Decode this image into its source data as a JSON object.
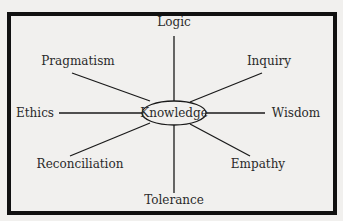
{
  "diagram": {
    "type": "mind-map",
    "center": {
      "label": "Knowledge",
      "x": 174,
      "y": 113,
      "rx": 32,
      "ry": 12
    },
    "nodes": [
      {
        "label": "Logic",
        "x": 174,
        "y": 26,
        "anchor": "middle",
        "line": [
          174,
          36,
          174,
          101
        ]
      },
      {
        "label": "Inquiry",
        "x": 269,
        "y": 65,
        "anchor": "middle",
        "line": [
          262,
          73,
          190,
          102
        ]
      },
      {
        "label": "Wisdom",
        "x": 296,
        "y": 117,
        "anchor": "middle",
        "line": [
          265,
          113,
          206,
          113
        ]
      },
      {
        "label": "Empathy",
        "x": 258,
        "y": 168,
        "anchor": "middle",
        "line": [
          250,
          156,
          190,
          124
        ]
      },
      {
        "label": "Tolerance",
        "x": 174,
        "y": 204,
        "anchor": "middle",
        "line": [
          174,
          193,
          174,
          125
        ]
      },
      {
        "label": "Reconciliation",
        "x": 80,
        "y": 168,
        "anchor": "middle",
        "line": [
          70,
          156,
          150,
          123
        ]
      },
      {
        "label": "Ethics",
        "x": 35,
        "y": 117,
        "anchor": "middle",
        "line": [
          59,
          113,
          142,
          113
        ]
      },
      {
        "label": "Pragmatism",
        "x": 78,
        "y": 65,
        "anchor": "middle",
        "line": [
          72,
          73,
          150,
          101
        ]
      }
    ],
    "colors": {
      "background": "#f1f0ee",
      "ink": "#1a1a1a",
      "frame": "#111111"
    }
  }
}
